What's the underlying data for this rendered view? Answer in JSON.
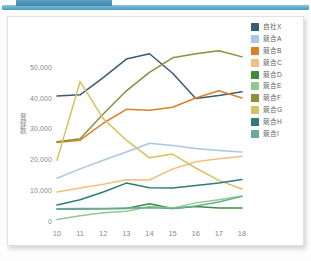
{
  "header": {
    "bar_color": "#63aac9",
    "accent_color": "#4a90b8"
  },
  "chart_data": {
    "type": "line",
    "title": "",
    "subtitle": "",
    "xlabel": "",
    "ylabel": "登録数",
    "x": [
      10,
      11,
      12,
      13,
      14,
      15,
      16,
      17,
      18
    ],
    "xtick_labels": [
      "10",
      "11",
      "12",
      "13",
      "14",
      "15",
      "16",
      "17",
      "18"
    ],
    "ytick_labels": [
      "0",
      "10,000",
      "20,000",
      "30,000",
      "40,000",
      "50,000"
    ],
    "yticks": [
      0,
      10000,
      20000,
      30000,
      40000,
      50000
    ],
    "ylim": [
      0,
      58000
    ],
    "xlim": [
      10,
      18
    ],
    "grid": false,
    "legend_position": "right",
    "series": [
      {
        "name": "自社X",
        "color": "#3b5a74",
        "values": [
          40800,
          41200,
          46800,
          52800,
          54500,
          48200,
          40000,
          41000,
          42200
        ]
      },
      {
        "name": "競合A",
        "color": "#a8c8e4",
        "values": [
          14200,
          17200,
          20000,
          22700,
          25500,
          24800,
          23800,
          23200,
          22700
        ]
      },
      {
        "name": "競合B",
        "color": "#d98028",
        "values": [
          25800,
          26500,
          32000,
          36500,
          36200,
          37200,
          40200,
          42500,
          40200
        ]
      },
      {
        "name": "競合C",
        "color": "#f5be7f",
        "values": [
          9700,
          11000,
          12200,
          13700,
          13600,
          17200,
          19500,
          20500,
          21300
        ]
      },
      {
        "name": "競合D",
        "color": "#3f8a3f",
        "values": [
          4200,
          4200,
          4300,
          4400,
          5900,
          4400,
          5000,
          4500,
          4500
        ]
      },
      {
        "name": "競合E",
        "color": "#8fc98f",
        "values": [
          800,
          2000,
          3000,
          3500,
          5000,
          4500,
          6200,
          7200,
          8400
        ]
      },
      {
        "name": "競合F",
        "color": "#8a8f3c",
        "values": [
          26000,
          27000,
          35000,
          42500,
          48500,
          53200,
          54500,
          55500,
          53500
        ]
      },
      {
        "name": "競合G",
        "color": "#d6c260",
        "values": [
          20000,
          45500,
          33500,
          26500,
          20800,
          22000,
          17500,
          13500,
          10700
        ]
      },
      {
        "name": "競合H",
        "color": "#2e7d73",
        "values": [
          5500,
          7200,
          9700,
          12600,
          11100,
          11000,
          11800,
          12600,
          13800
        ]
      },
      {
        "name": "競合I",
        "color": "#6aa99f",
        "values": [
          4300,
          4400,
          4400,
          4500,
          4600,
          4400,
          5200,
          6500,
          8300
        ]
      }
    ]
  }
}
